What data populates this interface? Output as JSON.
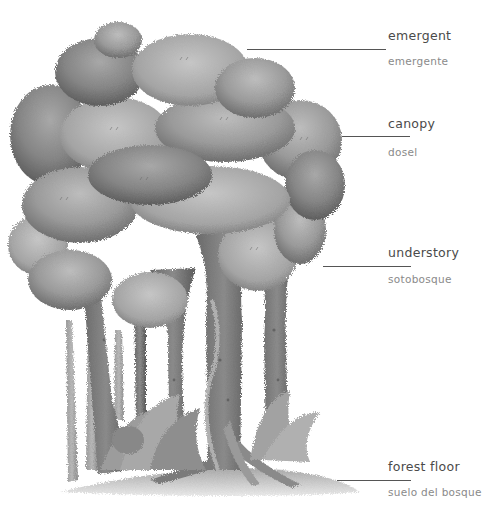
{
  "diagram": {
    "palette": {
      "background": "#ffffff",
      "foliage_light": "#b4b4b4",
      "foliage_mid": "#8e8e8e",
      "foliage_dark": "#6a6a6a",
      "trunk_dark": "#5a5a5a",
      "trunk_mid": "#7c7c7c",
      "ground": "#c8c8c8",
      "label_primary": "#4a4a4a",
      "label_secondary": "#8a8a8a",
      "leader_line": "#555555"
    },
    "layers": [
      {
        "id": "emergent",
        "label_en": "emergent",
        "label_es": "emergente"
      },
      {
        "id": "canopy",
        "label_en": "canopy",
        "label_es": "dosel"
      },
      {
        "id": "understory",
        "label_en": "understory",
        "label_es": "sotobosque"
      },
      {
        "id": "forest-floor",
        "label_en": "forest floor",
        "label_es": "suelo del bosque"
      }
    ]
  }
}
